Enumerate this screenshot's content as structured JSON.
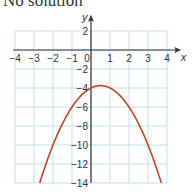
{
  "caption": "No solution",
  "chart_data": {
    "type": "line",
    "title": "No solution",
    "xlabel": "x",
    "ylabel": "y",
    "xlim": [
      -4,
      4
    ],
    "ylim": [
      -14,
      3
    ],
    "grid": true,
    "x_ticks": [
      "-4",
      "-3",
      "-2",
      "-1",
      "0",
      "1",
      "2",
      "3",
      "4"
    ],
    "y_ticks": [
      "2",
      "-2",
      "-4",
      "-6",
      "-8",
      "-10",
      "-12",
      "-14"
    ],
    "series": [
      {
        "name": "y = -x^2 + x - 4",
        "color": "#c8432b",
        "x": [
          -2.7,
          -2,
          -1.5,
          -1,
          -0.5,
          0,
          0.5,
          1,
          1.5,
          2,
          2.5,
          3,
          3.7
        ],
        "y": [
          -14,
          -10,
          -7.75,
          -6,
          -4.75,
          -4,
          -3.75,
          -4,
          -4.75,
          -6,
          -7.75,
          -10,
          -14
        ]
      }
    ],
    "colors": {
      "grid": "#bfe3ef",
      "axis": "#333333",
      "curve": "#c8432b"
    }
  }
}
